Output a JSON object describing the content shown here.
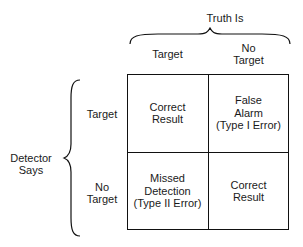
{
  "diagram": {
    "top_header": "Truth Is",
    "left_header": "Detector\nSays",
    "columns": [
      "Target",
      "No\nTarget"
    ],
    "rows": [
      "Target",
      "No\nTarget"
    ],
    "cells": [
      [
        "Correct\nResult",
        "False\nAlarm\n(Type I Error)"
      ],
      [
        "Missed\nDetection\n(Type II Error)",
        "Correct\nResult"
      ]
    ]
  }
}
